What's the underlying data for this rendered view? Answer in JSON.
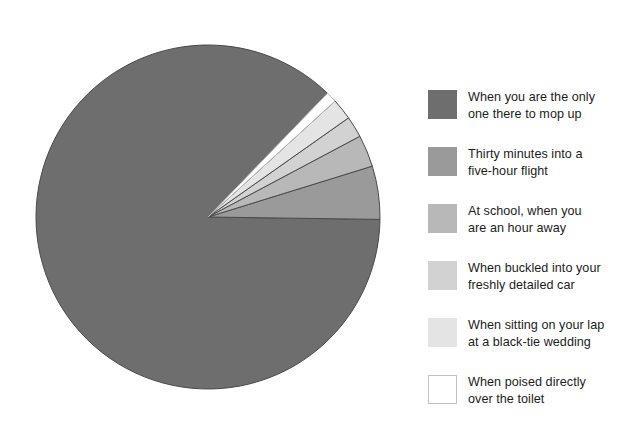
{
  "figure": {
    "background_color": "#ffffff",
    "title": ""
  },
  "chart_data": {
    "type": "pie",
    "title": "",
    "subtitle": "",
    "xlabel": "",
    "ylabel": "",
    "grid": false,
    "legend_position": "right",
    "center": {
      "x": 208,
      "y": 217
    },
    "radius": 172,
    "start_angle_deg": 46,
    "direction": "counterclockwise",
    "labels": [
      "When you are the only\none there to mop up",
      "Thirty minutes into a\nfive-hour flight",
      "At school, when you\nare an hour away",
      "When buckled into your\nfreshly detailed car",
      "When sitting on your lap\nat a black-tie wedding",
      "When poised directly\nover the toilet"
    ],
    "values": [
      87,
      5,
      3,
      2,
      2,
      1
    ],
    "percentages": [
      "87%",
      "5%",
      "3%",
      "2%",
      "2%",
      "1%"
    ],
    "angles_deg": [
      313.2,
      18.0,
      10.8,
      7.2,
      7.2,
      3.6
    ],
    "colors": [
      "#6e6e6e",
      "#9a9a9a",
      "#b8b8b8",
      "#d2d2d2",
      "#e4e4e4",
      "#ffffff"
    ],
    "slice_outline_color": "#4a4a4a",
    "white_slice_outline_color": "#b5b5b5"
  },
  "legend": {
    "items": [
      {
        "swatch_color": "#6e6e6e",
        "outlined": false,
        "label": "When you are the only\none there to mop up"
      },
      {
        "swatch_color": "#9a9a9a",
        "outlined": false,
        "label": "Thirty minutes into a\nfive-hour flight"
      },
      {
        "swatch_color": "#b8b8b8",
        "outlined": false,
        "label": "At school, when you\nare an hour away"
      },
      {
        "swatch_color": "#d2d2d2",
        "outlined": false,
        "label": "When buckled into your\nfreshly detailed car"
      },
      {
        "swatch_color": "#e4e4e4",
        "outlined": false,
        "label": "When sitting on your lap\nat a black-tie wedding"
      },
      {
        "swatch_color": "#ffffff",
        "outlined": true,
        "label": "When poised directly\nover the toilet"
      }
    ]
  }
}
